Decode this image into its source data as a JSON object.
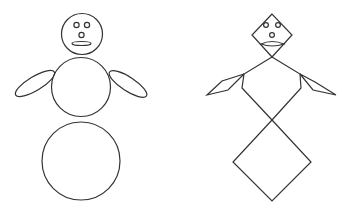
{
  "figures": [
    {
      "name": "snowman",
      "shapes": [
        "head-circle",
        "body-circle",
        "base-circle",
        "left-arm-ellipse",
        "right-arm-ellipse",
        "eyes",
        "nose",
        "mouth"
      ]
    },
    {
      "name": "diamond-figure",
      "shapes": [
        "head-diamond",
        "body-diamond",
        "base-diamond",
        "left-arm-diamond",
        "right-arm-diamond",
        "eyes",
        "nose",
        "mouth"
      ]
    }
  ],
  "colors": {
    "stroke": "#333333",
    "background": "#ffffff"
  }
}
